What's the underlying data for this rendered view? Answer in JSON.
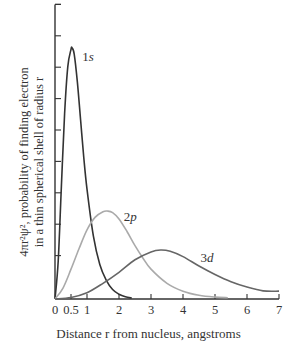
{
  "chart_data": {
    "type": "line",
    "title": "",
    "xlabel": "Distance r from nucleus, angstroms",
    "ylabel_line1": "4πr²ψ², probability of finding electron",
    "ylabel_line2": "in a thin spherical shell of radius r",
    "xlim": [
      0,
      7
    ],
    "ylim": [
      0,
      9
    ],
    "x_ticks": [
      0,
      0.5,
      1,
      2,
      3,
      4,
      5,
      6,
      7
    ],
    "x_tick_labels": [
      "0",
      "0.5",
      "1",
      "2",
      "3",
      "4",
      "5",
      "6",
      "7"
    ],
    "y_ticks": [
      0,
      1,
      2,
      3,
      4,
      5,
      6,
      7,
      8,
      9
    ],
    "y_tick_labels": [],
    "grid": false,
    "legend": "inline labels",
    "series": [
      {
        "name": "1s",
        "color": "#333333",
        "x": [
          0,
          0.1,
          0.2,
          0.3,
          0.4,
          0.5,
          0.53,
          0.6,
          0.7,
          0.8,
          0.9,
          1.0,
          1.2,
          1.4,
          1.6,
          1.8,
          2.0,
          2.2,
          2.4
        ],
        "values": [
          0,
          1.2,
          3.6,
          5.9,
          7.4,
          7.95,
          8.0,
          7.8,
          6.9,
          5.7,
          4.5,
          3.5,
          2.0,
          1.1,
          0.6,
          0.3,
          0.15,
          0.07,
          0.03
        ]
      },
      {
        "name": "2p",
        "color": "#aaaaaa",
        "x": [
          0,
          0.25,
          0.5,
          0.75,
          1.0,
          1.25,
          1.5,
          1.65,
          1.8,
          2.0,
          2.25,
          2.5,
          2.75,
          3.0,
          3.5,
          4.0,
          4.5,
          5.0,
          5.4
        ],
        "values": [
          0,
          0.35,
          0.95,
          1.6,
          2.2,
          2.6,
          2.78,
          2.8,
          2.75,
          2.55,
          2.15,
          1.7,
          1.3,
          0.95,
          0.5,
          0.25,
          0.12,
          0.06,
          0.04
        ]
      },
      {
        "name": "3d",
        "color": "#666666",
        "x": [
          0,
          0.5,
          1.0,
          1.5,
          2.0,
          2.5,
          3.0,
          3.3,
          3.6,
          4.0,
          4.5,
          5.0,
          5.5,
          6.0,
          6.5,
          7.0
        ],
        "values": [
          0,
          0.05,
          0.2,
          0.5,
          0.85,
          1.25,
          1.5,
          1.56,
          1.52,
          1.35,
          1.05,
          0.78,
          0.55,
          0.38,
          0.26,
          0.25
        ]
      }
    ],
    "annotations": [
      {
        "text": "1s",
        "x": 0.85,
        "y": 7.7
      },
      {
        "text": "2p",
        "x": 2.15,
        "y": 2.6
      },
      {
        "text": "3d",
        "x": 4.55,
        "y": 1.3
      }
    ]
  }
}
